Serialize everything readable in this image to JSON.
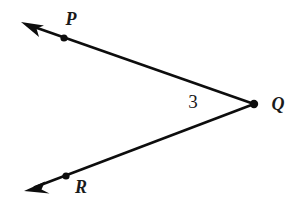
{
  "figure": {
    "kind": "geometry-angle-diagram",
    "background_color": "#ffffff",
    "stroke_color": "#0d0d0d",
    "label_color": "#1a1a1a",
    "stroke_width": 2.6
  },
  "labels": {
    "vertex": "Q",
    "upper_point": "P",
    "lower_point": "R",
    "angle_number": "3"
  },
  "geometry": {
    "vertex": {
      "name": "Q",
      "x": 254,
      "y": 104,
      "dot_radius": 4.2
    },
    "upper_point": {
      "name": "P",
      "x": 64,
      "y": 38,
      "dot_radius": 3.6
    },
    "lower_point": {
      "name": "R",
      "x": 66,
      "y": 176,
      "dot_radius": 3.6
    },
    "upper_ray": {
      "from_x": 254,
      "from_y": 104,
      "to_x": 29,
      "to_y": 25,
      "arrow_tip_x": 21,
      "arrow_tip_y": 22
    },
    "lower_ray": {
      "from_x": 254,
      "from_y": 104,
      "to_x": 33,
      "to_y": 188,
      "arrow_tip_x": 24,
      "arrow_tip_y": 191
    }
  },
  "label_positions": {
    "upper_point": {
      "x": 71,
      "y": 21
    },
    "vertex": {
      "x": 278,
      "y": 106
    },
    "lower_point": {
      "x": 81,
      "y": 189
    },
    "angle_number": {
      "x": 193,
      "y": 104
    }
  }
}
